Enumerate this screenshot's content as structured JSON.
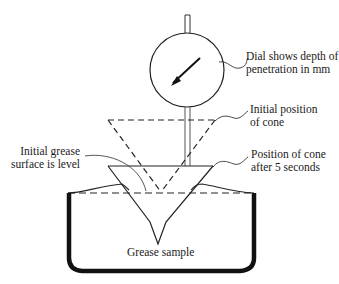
{
  "diagram": {
    "type": "cone-penetration-test",
    "labels": {
      "dial_line1": "Dial shows depth of",
      "dial_line2": "penetration in mm",
      "initial_line1": "Initial position",
      "initial_line2": "of cone",
      "surface_line1": "Initial grease",
      "surface_line2": "surface is level",
      "after_line1": "Position of cone",
      "after_line2": "after 5 seconds",
      "sample": "Grease sample"
    },
    "components": [
      "dial-gauge",
      "plunger-rod",
      "cone-initial-position",
      "cone-final-position",
      "grease-container",
      "grease-surface"
    ],
    "colors": {
      "line": "#1a1a1a",
      "background": "#ffffff"
    }
  }
}
